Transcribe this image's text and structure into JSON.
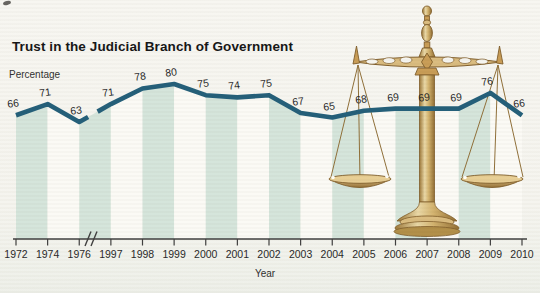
{
  "title": "Trust in the Judicial Branch of Government",
  "y_axis_label": "Percentage",
  "x_axis_label": "Year",
  "chart_data": {
    "type": "line",
    "title": "Trust in the Judicial Branch of Government",
    "xlabel": "Year",
    "ylabel": "Percentage",
    "categories": [
      "1972",
      "1974",
      "1976",
      "1997",
      "1998",
      "1999",
      "2000",
      "2001",
      "2002",
      "2003",
      "2004",
      "2005",
      "2006",
      "2007",
      "2008",
      "2009",
      "2010"
    ],
    "values": [
      66,
      71,
      63,
      71,
      78,
      80,
      75,
      74,
      75,
      67,
      65,
      68,
      69,
      69,
      69,
      76,
      66
    ],
    "point_labels_shown": true,
    "axis_break_between": [
      "1976",
      "1997"
    ],
    "y_axis_ticks": [],
    "legend": null,
    "background_style": "alternating vertical bands filling the area under the line between consecutive data points, starting with green between 1972 and 1974"
  },
  "colors": {
    "line": "#1e5b76",
    "band_green": "#d4e4da",
    "band_white": "#fbfaf5",
    "background": "#f6f5f0",
    "axis": "#3a3a3a",
    "label_text": "#1d1d1d",
    "brass": "#c79a52",
    "brass_dark": "#7d5a26",
    "brass_light": "#e9d7a4"
  },
  "decoration": "scales-of-justice"
}
